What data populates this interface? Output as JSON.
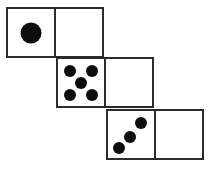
{
  "figure": {
    "background_color": "#ffffff",
    "line_color": "#2b2b2b",
    "pip_color": "#0d0d0d",
    "canvas": {
      "width": 212,
      "height": 170
    }
  },
  "chart_data": {
    "type": "diagram",
    "rows": [
      {
        "name": "top-row",
        "x": 6,
        "y": 7,
        "faces": [
          {
            "name": "face-one",
            "value": 1,
            "pips": 1,
            "blank": false
          },
          {
            "name": "face-blank-top",
            "value": 0,
            "pips": 0,
            "blank": true
          }
        ]
      },
      {
        "name": "middle-row",
        "x": 56,
        "y": 57,
        "faces": [
          {
            "name": "face-five",
            "value": 5,
            "pips": 5,
            "blank": false
          },
          {
            "name": "face-blank-middle",
            "value": 0,
            "pips": 0,
            "blank": true
          }
        ]
      },
      {
        "name": "bottom-row",
        "x": 106,
        "y": 109,
        "faces": [
          {
            "name": "face-three",
            "value": 3,
            "pips": 3,
            "blank": false
          },
          {
            "name": "face-blank-bottom",
            "value": 0,
            "pips": 0,
            "blank": true
          }
        ]
      }
    ],
    "square_size": {
      "width": 50,
      "height": 51
    },
    "pip_layouts": {
      "one": [
        {
          "cx": 50,
          "cy": 50,
          "d": 21
        }
      ],
      "five": [
        {
          "cx": 27,
          "cy": 25,
          "d": 12
        },
        {
          "cx": 73,
          "cy": 25,
          "d": 12
        },
        {
          "cx": 50,
          "cy": 50,
          "d": 12
        },
        {
          "cx": 27,
          "cy": 76,
          "d": 12
        },
        {
          "cx": 73,
          "cy": 76,
          "d": 12
        }
      ],
      "three": [
        {
          "cx": 24,
          "cy": 79,
          "d": 12
        },
        {
          "cx": 48,
          "cy": 55,
          "d": 12
        },
        {
          "cx": 72,
          "cy": 26,
          "d": 12
        }
      ]
    }
  }
}
